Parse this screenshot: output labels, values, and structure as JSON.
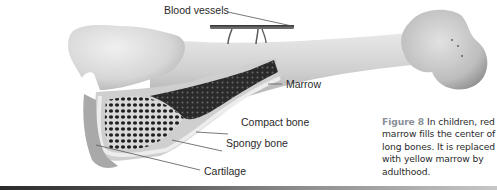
{
  "figure": {
    "labels": {
      "blood_vessels": "Blood vessels",
      "marrow": "Marrow",
      "compact_bone": "Compact bone",
      "spongy_bone": "Spongy bone",
      "cartilage": "Cartilage"
    },
    "caption": {
      "figure_number": "Figure 8",
      "text": "In children, red marrow fills the center of long bones. It is replaced with yellow marrow by adulthood."
    },
    "colors": {
      "bone_light": "#e4e4e4",
      "bone_mid": "#c4c4c4",
      "bone_dark": "#8e8e8e",
      "marrow_dark": "#1e1e1e",
      "caption_figure_number": "#8a8f98",
      "label_text": "#2a2a2a",
      "leader_line": "#555555"
    }
  }
}
